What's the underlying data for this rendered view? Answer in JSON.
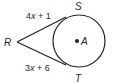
{
  "diagram": {
    "type": "geometry",
    "points": {
      "R": {
        "label": "R"
      },
      "S": {
        "label": "S"
      },
      "T": {
        "label": "T"
      },
      "A": {
        "label": "A"
      }
    },
    "segments": {
      "RS": {
        "expr_coef": "4",
        "expr_var": "x",
        "expr_rest": " + 1"
      },
      "RT": {
        "expr_coef": "3",
        "expr_var": "x",
        "expr_rest": " + 6"
      }
    },
    "colors": {
      "stroke": "#231f20",
      "background": "#ffffff"
    }
  }
}
